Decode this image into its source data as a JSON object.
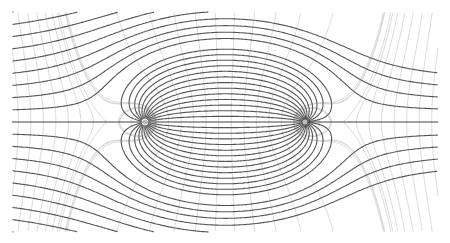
{
  "diagram": {
    "type": "flow-field",
    "width": 450,
    "height": 243,
    "clip": {
      "x0": 12,
      "x1": 438,
      "y0": 12,
      "y1": 232
    },
    "center_y": 122,
    "source": {
      "x": 145,
      "y": 122
    },
    "sink": {
      "x": 305,
      "y": 122
    },
    "uniform_flow_U": 1.0,
    "strength": 48,
    "streamline_count_each_side": 13,
    "equipotential_count": 34,
    "colors": {
      "background": "#ffffff",
      "streamline": "#555555",
      "equipotential": "#cfcfcf",
      "axis": "#444444"
    }
  }
}
